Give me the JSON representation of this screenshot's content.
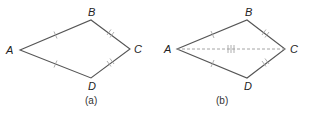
{
  "figures": [
    {
      "id": "a",
      "caption": "(a)",
      "vertices": {
        "A": {
          "label": "A",
          "x": 20,
          "y": 50
        },
        "B": {
          "label": "B",
          "x": 91,
          "y": 20
        },
        "C": {
          "label": "C",
          "x": 130,
          "y": 49
        },
        "D": {
          "label": "D",
          "x": 91,
          "y": 78
        }
      },
      "edges": [
        {
          "from": "A",
          "to": "B",
          "ticks": 1
        },
        {
          "from": "B",
          "to": "C",
          "ticks": 2
        },
        {
          "from": "C",
          "to": "D",
          "ticks": 2
        },
        {
          "from": "D",
          "to": "A",
          "ticks": 1
        }
      ],
      "diagonal": null
    },
    {
      "id": "b",
      "caption": "(b)",
      "vertices": {
        "A": {
          "label": "A",
          "x": 177,
          "y": 49
        },
        "B": {
          "label": "B",
          "x": 247,
          "y": 20
        },
        "C": {
          "label": "C",
          "x": 285,
          "y": 49
        },
        "D": {
          "label": "D",
          "x": 247,
          "y": 78
        }
      },
      "edges": [
        {
          "from": "A",
          "to": "B",
          "ticks": 1
        },
        {
          "from": "B",
          "to": "C",
          "ticks": 2
        },
        {
          "from": "C",
          "to": "D",
          "ticks": 2
        },
        {
          "from": "D",
          "to": "A",
          "ticks": 1
        }
      ],
      "diagonal": {
        "from": "A",
        "to": "C",
        "ticks": 3,
        "style": "dashed"
      }
    }
  ]
}
